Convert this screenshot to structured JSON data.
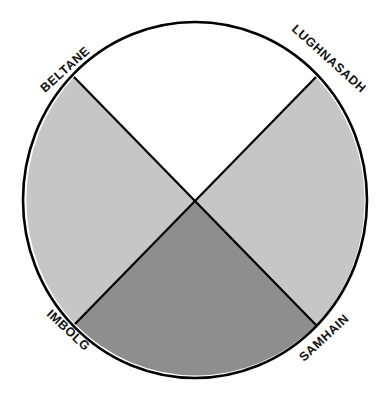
{
  "diagram": {
    "colors": {
      "top": "#ffffff",
      "left": "#c6c6c6",
      "right": "#c6c6c6",
      "bottom": "#8e8e8e",
      "stroke": "#000000"
    },
    "labels": {
      "top_left": "BELTANE",
      "top_right": "LUGHNASADH",
      "bottom_left": "IMBOLG",
      "bottom_right": "SAMHAIN"
    },
    "segments": [
      {
        "position": "top",
        "between": [
          "BELTANE",
          "LUGHNASADH"
        ],
        "shade": "white"
      },
      {
        "position": "right",
        "between": [
          "LUGHNASADH",
          "SAMHAIN"
        ],
        "shade": "light-gray"
      },
      {
        "position": "bottom",
        "between": [
          "SAMHAIN",
          "IMBOLG"
        ],
        "shade": "dark-gray"
      },
      {
        "position": "left",
        "between": [
          "IMBOLG",
          "BELTANE"
        ],
        "shade": "light-gray"
      }
    ]
  }
}
